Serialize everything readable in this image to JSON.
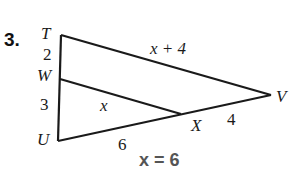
{
  "problem": {
    "number": "3.",
    "answer": "x = 6"
  },
  "diagram": {
    "vertices": {
      "T": {
        "label": "T",
        "x": 61,
        "y": 35
      },
      "W": {
        "label": "W",
        "x": 60,
        "y": 79
      },
      "U": {
        "label": "U",
        "x": 58,
        "y": 141
      },
      "V": {
        "label": "V",
        "x": 271,
        "y": 95
      },
      "X": {
        "label": "X",
        "x": 181,
        "y": 114
      }
    },
    "segments": [
      {
        "from": "T",
        "to": "U"
      },
      {
        "from": "T",
        "to": "V"
      },
      {
        "from": "U",
        "to": "V"
      },
      {
        "from": "W",
        "to": "X"
      }
    ],
    "measures": {
      "TW": "2",
      "WU": "3",
      "TV": "x + 4",
      "WX": "x",
      "UX": "6",
      "XV": "4"
    },
    "stroke_color": "#1a1a1a",
    "answer_color": "#555555"
  }
}
